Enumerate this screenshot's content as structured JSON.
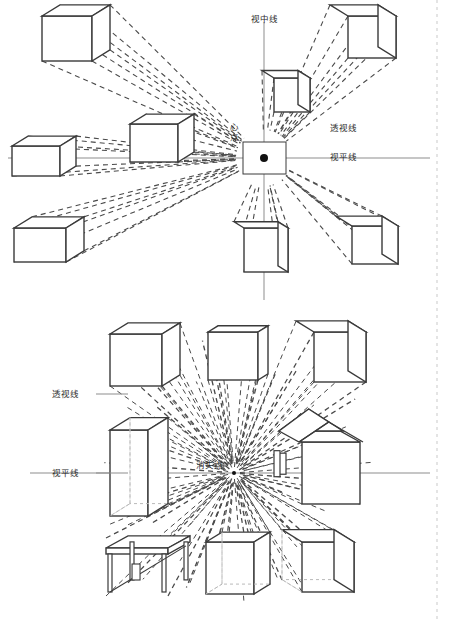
{
  "page": {
    "width": 453,
    "height": 621,
    "background": "#ffffff",
    "margin_rule": {
      "name": "right-margin-dashed-line",
      "x": 437,
      "color": "#c9c9c9"
    }
  },
  "colors": {
    "outline": "#3a3a3a",
    "dashed_perspective": "#4a4a4a",
    "horizon": "#8d8d8d",
    "center_axis": "#8d8d8d",
    "hidden_edge": "#b9b9b9",
    "label_text": "#2b2b2b",
    "margin": "#c9c9c9"
  },
  "panels": [
    {
      "id": "top-panel",
      "name": "one-point-perspective-center-point",
      "focus": {
        "name": "center-point",
        "label": "心点",
        "label_chars": [
          "心",
          "点"
        ],
        "x": 264,
        "y": 158,
        "box": {
          "x": 243,
          "y": 142,
          "width": 43,
          "height": 32
        },
        "dot_radius": 4
      },
      "lines": [
        {
          "name": "center-vision-line",
          "label": "视中线",
          "orientation": "vertical",
          "x": 264,
          "y1": 22,
          "y2": 300
        },
        {
          "name": "horizon-line",
          "label": "视平线",
          "orientation": "horizontal",
          "y": 158,
          "x1": 8,
          "x2": 430
        }
      ],
      "labels": [
        {
          "name": "center-vision-line-label",
          "text": "视中线",
          "x": 264,
          "y": 18
        },
        {
          "name": "perspective-lines-label",
          "text": "透视线",
          "x": 330,
          "y": 128
        },
        {
          "name": "horizon-line-label",
          "text": "视平线",
          "x": 330,
          "y": 157
        },
        {
          "name": "center-point-label",
          "text": "心点",
          "x": 234,
          "y": 126
        }
      ],
      "cubes": [
        {
          "name": "cube-top-left",
          "x": 42,
          "y": 16,
          "w": 50,
          "h": 45,
          "depth": 18
        },
        {
          "name": "cube-top-right",
          "x": 348,
          "y": 16,
          "w": 48,
          "h": 42,
          "depth": 18
        },
        {
          "name": "cube-upper-center",
          "x": 274,
          "y": 78,
          "w": 36,
          "h": 34,
          "depth": 12
        },
        {
          "name": "cube-mid-left",
          "x": 130,
          "y": 124,
          "w": 48,
          "h": 38,
          "depth": 16
        },
        {
          "name": "cube-far-left",
          "x": 12,
          "y": 146,
          "w": 48,
          "h": 30,
          "depth": 16
        },
        {
          "name": "cube-lower-left",
          "x": 14,
          "y": 228,
          "w": 52,
          "h": 34,
          "depth": 18
        },
        {
          "name": "cube-lower-center",
          "x": 244,
          "y": 228,
          "w": 44,
          "h": 44,
          "depth": 10
        },
        {
          "name": "cube-lower-right",
          "x": 352,
          "y": 226,
          "w": 46,
          "h": 38,
          "depth": 16
        }
      ]
    },
    {
      "id": "bottom-panel",
      "name": "one-point-perspective-vanishing-point",
      "focus": {
        "name": "vanishing-point",
        "label": "消失点",
        "x": 234,
        "y": 473,
        "ray_count": 40
      },
      "lines": [
        {
          "name": "horizon-line",
          "label": "视平线",
          "orientation": "horizontal",
          "y": 473,
          "x1": 30,
          "x2": 430
        }
      ],
      "labels": [
        {
          "name": "perspective-lines-label",
          "text": "透视线",
          "x": 68,
          "y": 396,
          "leader_to_x": 120
        },
        {
          "name": "horizon-line-label",
          "text": "视平线",
          "x": 68,
          "y": 473,
          "leader_to_x": 120
        },
        {
          "name": "vanishing-point-label",
          "text": "消失点",
          "x": 212,
          "y": 466
        }
      ],
      "objects": [
        {
          "name": "cube-top-left",
          "type": "cube",
          "x": 110,
          "y": 334,
          "w": 52,
          "h": 52,
          "depth": 18
        },
        {
          "name": "cube-top-center",
          "type": "cube",
          "x": 208,
          "y": 332,
          "w": 50,
          "h": 48,
          "depth": 10
        },
        {
          "name": "cube-top-right",
          "type": "cube",
          "x": 314,
          "y": 332,
          "w": 52,
          "h": 50,
          "depth": 18
        },
        {
          "name": "box-transparent-left",
          "type": "transparent-box",
          "x": 110,
          "y": 430,
          "w": 38,
          "h": 86,
          "depth": 20
        },
        {
          "name": "house-right",
          "type": "house",
          "x": 302,
          "y": 442,
          "w": 58,
          "h": 62,
          "depth": 20
        },
        {
          "name": "table-bottom-left",
          "type": "table",
          "x": 106,
          "y": 538,
          "w": 62,
          "h": 58,
          "depth": 22
        },
        {
          "name": "box-bottom-center",
          "type": "transparent-box",
          "x": 206,
          "y": 542,
          "w": 48,
          "h": 52,
          "depth": 16
        },
        {
          "name": "cube-bottom-right",
          "type": "transparent-cube",
          "x": 302,
          "y": 542,
          "w": 52,
          "h": 50,
          "depth": 20
        }
      ]
    }
  ]
}
